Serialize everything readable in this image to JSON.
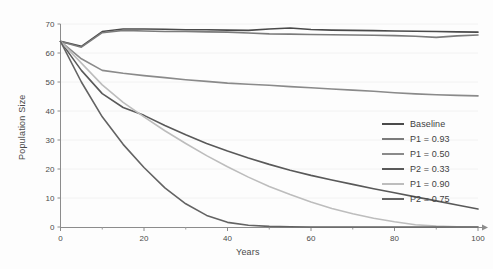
{
  "chart_data": {
    "type": "line",
    "title": "",
    "xlabel": "Years",
    "ylabel": "Population Size",
    "xlim": [
      0,
      100
    ],
    "ylim": [
      0,
      70
    ],
    "xticks": [
      0,
      20,
      40,
      60,
      80,
      100
    ],
    "xtick_labels": [
      "0",
      "20",
      "40",
      "60",
      "80",
      "100"
    ],
    "xminor_ticks": [
      10,
      30,
      50,
      70,
      90
    ],
    "yticks": [
      0,
      10,
      20,
      30,
      40,
      50,
      60,
      70
    ],
    "ytick_labels": [
      "0",
      "10",
      "20",
      "30",
      "40",
      "50",
      "60",
      "70"
    ],
    "grid": "faint-horizontal",
    "legend_position": "right-middle",
    "x": [
      0,
      5,
      10,
      15,
      20,
      25,
      30,
      35,
      40,
      45,
      50,
      55,
      60,
      65,
      70,
      75,
      80,
      85,
      90,
      95,
      100
    ],
    "series": [
      {
        "name": "Baseline",
        "color": "#4a4a4a",
        "values": [
          64.0,
          62.3,
          67.4,
          68.3,
          68.3,
          68.2,
          68.0,
          68.0,
          67.9,
          67.8,
          68.3,
          68.6,
          68.1,
          67.9,
          67.8,
          67.7,
          67.6,
          67.5,
          67.4,
          67.3,
          67.2
        ]
      },
      {
        "name": "P1 = 0.93",
        "color": "#7b7b7b",
        "values": [
          64.0,
          62.0,
          67.0,
          67.8,
          67.6,
          67.4,
          67.4,
          67.3,
          67.2,
          66.9,
          66.6,
          66.5,
          66.4,
          66.3,
          66.2,
          66.1,
          66.0,
          65.8,
          65.4,
          65.9,
          66.2
        ]
      },
      {
        "name": "P1 = 0.50",
        "color": "#8a8a8a",
        "values": [
          64.0,
          58.0,
          54.0,
          53.0,
          52.2,
          51.5,
          50.8,
          50.2,
          49.6,
          49.2,
          48.9,
          48.4,
          48.0,
          47.6,
          47.2,
          46.8,
          46.3,
          45.9,
          45.6,
          45.4,
          45.2
        ]
      },
      {
        "name": "P2 = 0.33",
        "color": "#595959",
        "values": [
          64.0,
          54.0,
          46.0,
          41.2,
          38.5,
          35.0,
          31.8,
          28.8,
          26.2,
          23.8,
          21.6,
          19.6,
          17.8,
          16.2,
          14.7,
          13.2,
          11.8,
          10.4,
          9.0,
          7.6,
          6.2
        ]
      },
      {
        "name": "P1 = 0.90",
        "color": "#bdbdbd",
        "values": [
          64.0,
          56.5,
          49.0,
          43.0,
          38.0,
          33.2,
          28.8,
          24.6,
          20.8,
          17.2,
          14.0,
          11.2,
          8.6,
          6.4,
          4.6,
          3.0,
          1.8,
          0.8,
          0.3,
          0.1,
          0.0
        ]
      },
      {
        "name": "P2 = 0.75",
        "color": "#636363",
        "values": [
          64.0,
          50.0,
          38.0,
          28.5,
          20.5,
          13.5,
          8.0,
          4.0,
          1.6,
          0.6,
          0.2,
          0.1,
          0.0,
          0.0,
          0.0,
          0.0,
          0.0,
          0.0,
          0.0,
          0.0,
          0.0
        ]
      }
    ]
  },
  "legend": {
    "items": [
      {
        "label": "Baseline",
        "color": "#4a4a4a"
      },
      {
        "label": "P1 = 0.93",
        "color": "#7b7b7b"
      },
      {
        "label": "P1 = 0.50",
        "color": "#8a8a8a"
      },
      {
        "label": "P2 = 0.33",
        "color": "#595959"
      },
      {
        "label": "P1 = 0.90",
        "color": "#bdbdbd"
      },
      {
        "label": "P2 = 0.75",
        "color": "#636363"
      }
    ]
  },
  "axes": {
    "x_title": "Years",
    "y_title": "Population Size"
  }
}
